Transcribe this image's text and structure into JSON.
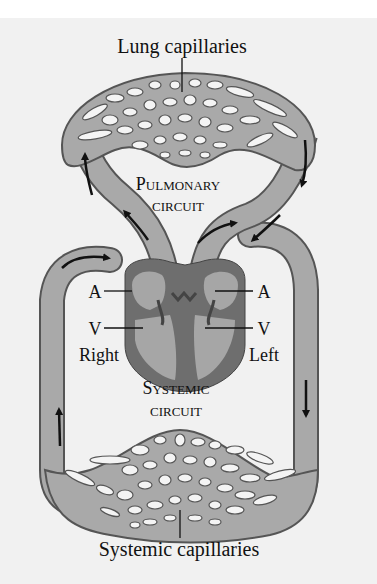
{
  "labels": {
    "lung_capillaries": "Lung capillaries",
    "pulmonary_1": "PULMONARY",
    "pulmonary_1_cap": "P",
    "pulmonary_1_rest": "ULMONARY",
    "pulmonary_2": "CIRCUIT",
    "systemic_1_cap": "S",
    "systemic_1_rest": "YSTEMIC",
    "systemic_2": "CIRCUIT",
    "atrium_right": "A",
    "ventricle_right": "V",
    "atrium_left": "A",
    "ventricle_left": "V",
    "right": "Right",
    "left": "Left",
    "systemic_capillaries": "Systemic capillaries"
  },
  "colors": {
    "background": "#ffffff",
    "panel": "#f1f1f1",
    "vessel": "#a9a9a9",
    "vessel_outline": "#555555",
    "heart_wall": "#6e6e6e",
    "heart_chamber": "#a6a6a6",
    "arrow": "#111111"
  }
}
